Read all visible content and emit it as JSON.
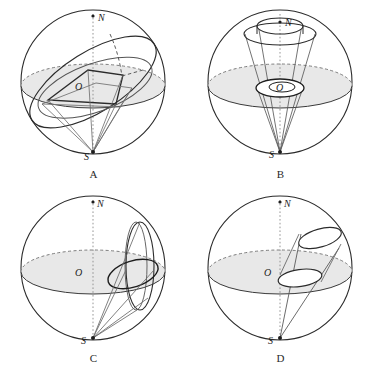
{
  "figure": {
    "background_color": "#ffffff",
    "ink_color": "#2b2b2b",
    "equator_fill_color": "#e8e8e8",
    "panels": [
      {
        "id": "A",
        "caption": "A",
        "description": "Sphere with tilted great-circle band and quadrilateral region projected from S",
        "labels": {
          "north": "N",
          "center": "O",
          "south": "S"
        }
      },
      {
        "id": "B",
        "caption": "B",
        "description": "Cone from S through a small circle at the centre opening to a circle near N",
        "labels": {
          "north": "N",
          "center": "O",
          "south": "S"
        }
      },
      {
        "id": "C",
        "caption": "C",
        "description": "Sphere with a circle on the right flank and projection rays from S",
        "labels": {
          "north": "N",
          "center": "O",
          "south": "S"
        }
      },
      {
        "id": "D",
        "caption": "D",
        "description": "Oblique tube from S with two elliptical cross sections",
        "labels": {
          "north": "N",
          "center": "O",
          "south": "S"
        }
      }
    ]
  }
}
